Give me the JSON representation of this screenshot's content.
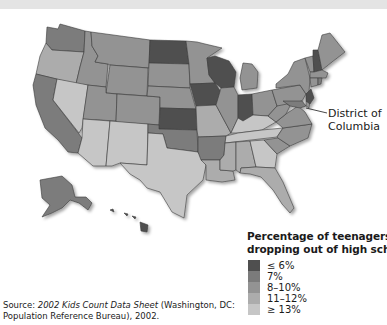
{
  "title_strip": {
    "text": ""
  },
  "map": {
    "colors": {
      "le6": "#4f4f4f",
      "p7": "#7b7b7b",
      "p8_10": "#939393",
      "p11_12": "#acacac",
      "ge13": "#c6c6c6"
    },
    "callout": {
      "label_line1": "District of",
      "label_line2": "Columbia"
    }
  },
  "legend": {
    "title_line1": "Percentage of teenagers",
    "title_line2": "dropping out of high school",
    "items": [
      {
        "label": "≤ 6%",
        "color": "#4f4f4f"
      },
      {
        "label": "7%",
        "color": "#7b7b7b"
      },
      {
        "label": "8–10%",
        "color": "#939393"
      },
      {
        "label": "11–12%",
        "color": "#acacac"
      },
      {
        "label": "≥ 13%",
        "color": "#c6c6c6"
      }
    ]
  },
  "source": {
    "prefix": "Source: ",
    "title": "2002 Kids Count Data Sheet",
    "suffix": " (Washington, DC:",
    "line2": "Population Reference Bureau), 2002."
  }
}
